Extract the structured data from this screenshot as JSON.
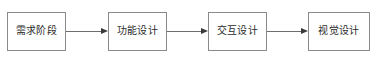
{
  "diagram": {
    "type": "horizontal-flowchart",
    "title": "",
    "orientation": "left-to-right",
    "colors": {
      "node_border": "#8a8a8a",
      "node_fill": "#ffffff",
      "text": "#2b2b2b",
      "connector": "#6e6e6e",
      "arrowhead": "#3a3a3a",
      "background": "#ffffff"
    },
    "nodes": [
      {
        "id": "node-1",
        "label": "需求阶段"
      },
      {
        "id": "node-2",
        "label": "功能设计"
      },
      {
        "id": "node-3",
        "label": "交互设计"
      },
      {
        "id": "node-4",
        "label": "视觉设计"
      }
    ],
    "connectors": [
      {
        "id": "arrow-1",
        "from": "node-1",
        "to": "node-2",
        "icon": "arrow-right-icon"
      },
      {
        "id": "arrow-2",
        "from": "node-2",
        "to": "node-3",
        "icon": "arrow-right-icon"
      },
      {
        "id": "arrow-3",
        "from": "node-3",
        "to": "node-4",
        "icon": "arrow-right-icon"
      }
    ]
  }
}
